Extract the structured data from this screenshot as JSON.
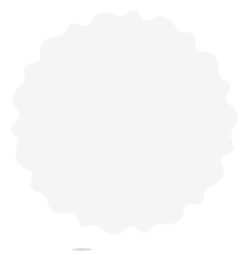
{
  "image": {
    "title": "3D isosurface reconstruction of a spherical particle",
    "kind": "grayscale-rendered-3d-surface",
    "width_px": 248,
    "height_px": 255,
    "background_color": "#ffffff",
    "alt_text": "Grayscale three-dimensional surface rendering of a roughly spherical, knobby particle viewed down a symmetry axis, showing a bright central pore surrounded by four smaller pores and a scalloped rim of peripheral knobs."
  },
  "palette": {
    "background": "#ffffff",
    "surface_highlight": "#d2d2d2",
    "surface_midtone": "#a8a8a8",
    "surface_shadow": "#6e6e6e",
    "rim_dark": "#4a4a4a",
    "groove_dark": "#5c5c5c",
    "pore_bright": "#fdfdfd",
    "pore_rim": "#5a5a5a"
  },
  "particle": {
    "label": "spherical-particle",
    "center_x": 123,
    "center_y": 122,
    "radius_x": 110,
    "radius_y": 109,
    "bounding_box": {
      "left": 13,
      "top": 13,
      "right": 233,
      "bottom": 232
    },
    "lobe_count": 22,
    "lobe_amplitude": 5.5,
    "silhouette_description": "lumpy near-circular outline with regular peripheral knobs"
  },
  "pores": [
    {
      "name": "central-pore",
      "x": 123,
      "y": 122,
      "radius": 4.2,
      "brightness": "bright-white"
    },
    {
      "name": "upper-pore",
      "x": 122,
      "y": 64,
      "radius": 3.6,
      "brightness": "mid-gray"
    },
    {
      "name": "left-pore",
      "x": 68,
      "y": 108,
      "radius": 3.4,
      "brightness": "mid-gray"
    },
    {
      "name": "right-pore",
      "x": 179,
      "y": 108,
      "radius": 3.4,
      "brightness": "mid-gray"
    },
    {
      "name": "lower-left-pore",
      "x": 88,
      "y": 176,
      "radius": 3.3,
      "brightness": "mid-gray"
    },
    {
      "name": "lower-right-pore",
      "x": 158,
      "y": 176,
      "radius": 3.3,
      "brightness": "mid-gray"
    }
  ],
  "grooves": [
    {
      "name": "groove-upper-left",
      "from": [
        122,
        64
      ],
      "to": [
        74,
        96
      ]
    },
    {
      "name": "groove-upper-right",
      "from": [
        122,
        64
      ],
      "to": [
        172,
        96
      ]
    },
    {
      "name": "groove-left-lower",
      "from": [
        68,
        108
      ],
      "to": [
        88,
        170
      ]
    },
    {
      "name": "groove-right-lower",
      "from": [
        179,
        108
      ],
      "to": [
        158,
        170
      ]
    },
    {
      "name": "groove-bottom",
      "from": [
        88,
        176
      ],
      "to": [
        158,
        176
      ]
    },
    {
      "name": "groove-upper-arc",
      "from": [
        96,
        70
      ],
      "to": [
        150,
        74
      ]
    }
  ],
  "lighting": {
    "source": "upper-left",
    "highlight_x": 96,
    "highlight_y": 96,
    "ambient": "diffuse"
  },
  "artifacts": [
    {
      "name": "bottom-smudge",
      "x": 72,
      "y": 248,
      "width": 20,
      "height": 3
    }
  ]
}
